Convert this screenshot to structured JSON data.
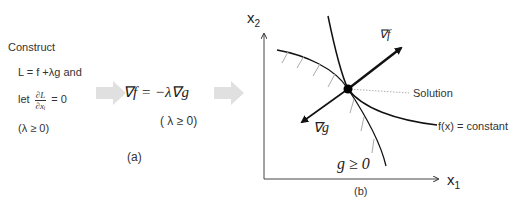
{
  "panel_a": {
    "construct": "Construct",
    "lagrangian": "L = f +λg and",
    "let": "let",
    "partial_num": "∂L",
    "partial_den": "∂xᵢ",
    "equals_zero": "= 0",
    "lambda_cond": "(λ ≥ 0)",
    "gradient_eq": "∇f = −λ∇g",
    "gradient_cond": "( λ ≥ 0)",
    "caption": "(a)"
  },
  "panel_b": {
    "y_axis_label": "x",
    "y_axis_sub": "2",
    "x_axis_label": "x",
    "x_axis_sub": "1",
    "grad_f_label": "∇f",
    "grad_g_label": "∇g",
    "solution_label": "Solution",
    "contour_label": "f(x) = constant",
    "region_label": "g ≥ 0",
    "caption": "(b)"
  },
  "colors": {
    "arrow_fill": "#e0e0e0",
    "line": "#111111",
    "hatch": "#aaaaaa",
    "leader": "#999999"
  }
}
